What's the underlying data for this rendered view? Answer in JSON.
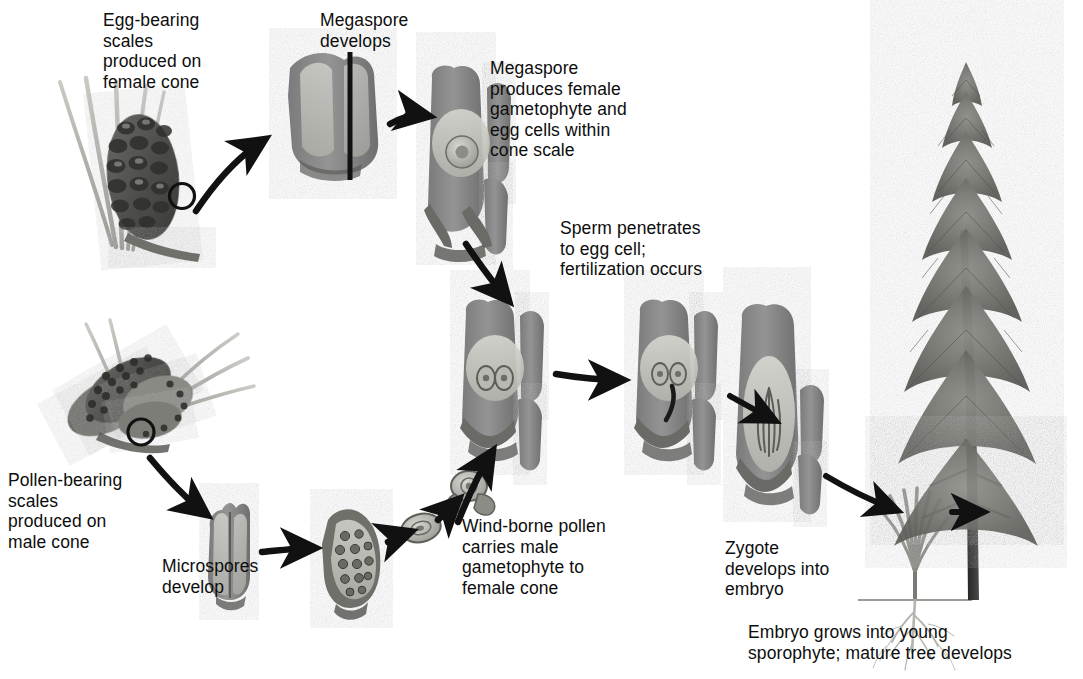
{
  "figure": {
    "kind": "life-cycle-diagram",
    "background_color": "#ffffff",
    "ink_color": "#0d0d0d",
    "tissue_gray": "#8a8a8a",
    "tissue_light": "#c9c9c4",
    "tissue_dark": "#4a4a4a"
  },
  "labels": {
    "egg_bearing_scales": "Egg-bearing\nscales\nproduced on\nfemale cone",
    "megaspore_develops": "Megaspore\ndevelops",
    "megaspore_produces": "Megaspore\nproduces female\ngametophyte and\negg cells within\ncone scale",
    "sperm_penetrates": "Sperm penetrates\nto egg cell;\nfertilization occurs",
    "pollen_bearing_scales": "Pollen-bearing\nscales\nproduced on\nmale cone",
    "microspores_develop": "Microspores\ndevelop",
    "wind_borne_pollen": "Wind-borne pollen\ncarries male\ngametophyte to\nfemale cone",
    "zygote_develops": "Zygote\ndevelops into\nembryo",
    "embryo_grows": "Embryo grows into young\nsporophyte; mature tree develops"
  },
  "stages": [
    {
      "id": "female-cone",
      "name": "Egg-bearing female pine cone with needles",
      "caption_key": "egg_bearing_scales"
    },
    {
      "id": "ovulate-scale",
      "name": "Ovulate cone scale, megaspore develops",
      "caption_key": "megaspore_develops"
    },
    {
      "id": "female-gametophyte",
      "name": "Cone scale with female gametophyte and egg cells",
      "caption_key": "megaspore_produces"
    },
    {
      "id": "fertilization",
      "name": "Cone scale at fertilization, sperm reaching egg",
      "caption_key": "sperm_penetrates"
    },
    {
      "id": "zygote-scale",
      "name": "Cone scale containing zygote",
      "caption_key": "sperm_penetrates"
    },
    {
      "id": "embryo-seed",
      "name": "Seed containing developing embryo",
      "caption_key": "zygote_develops"
    },
    {
      "id": "male-cone",
      "name": "Pollen-bearing male cone cluster",
      "caption_key": "pollen_bearing_scales"
    },
    {
      "id": "microsporangium",
      "name": "Microsporangium with microspores",
      "caption_key": "microspores_develop"
    },
    {
      "id": "microspore-sac",
      "name": "Microsporangium sac with pollen mother cells",
      "caption_key": "microspores_develop"
    },
    {
      "id": "pollen-grain",
      "name": "Single pollen grain in flight",
      "caption_key": "wind_borne_pollen"
    },
    {
      "id": "pollen-winged",
      "name": "Winged pollen grain reaching ovule",
      "caption_key": "wind_borne_pollen"
    },
    {
      "id": "seedling",
      "name": "Young sporophyte seedling with roots",
      "caption_key": "embryo_grows"
    },
    {
      "id": "mature-tree",
      "name": "Mature pine tree sporophyte",
      "caption_key": "embryo_grows"
    }
  ],
  "arrows": [
    {
      "from": "female-cone",
      "to": "ovulate-scale"
    },
    {
      "from": "ovulate-scale",
      "to": "female-gametophyte"
    },
    {
      "from": "female-gametophyte",
      "to": "fertilization"
    },
    {
      "from": "fertilization",
      "to": "zygote-scale"
    },
    {
      "from": "zygote-scale",
      "to": "embryo-seed"
    },
    {
      "from": "embryo-seed",
      "to": "seedling"
    },
    {
      "from": "seedling",
      "to": "mature-tree"
    },
    {
      "from": "male-cone",
      "to": "microsporangium"
    },
    {
      "from": "microsporangium",
      "to": "microspore-sac"
    },
    {
      "from": "microspore-sac",
      "to": "pollen-grain"
    },
    {
      "from": "pollen-grain",
      "to": "pollen-winged"
    },
    {
      "from": "pollen-winged",
      "to": "fertilization"
    }
  ]
}
